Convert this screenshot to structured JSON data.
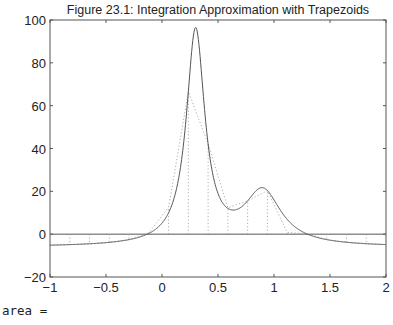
{
  "chart_data": {
    "type": "line",
    "title": "Figure 23.1: Integration Approximation with Trapezoids",
    "xlabel": "",
    "ylabel": "",
    "xlim": [
      -1,
      2
    ],
    "ylim": [
      -20,
      100
    ],
    "grid": false,
    "legend": null,
    "xticks": [
      -1,
      -0.5,
      0,
      0.5,
      1,
      1.5,
      2
    ],
    "xtick_labels": [
      "−1",
      "−0.5",
      "0",
      "0.5",
      "1",
      "1.5",
      "2"
    ],
    "yticks": [
      -20,
      0,
      20,
      40,
      60,
      80,
      100
    ],
    "ytick_labels": [
      "−20",
      "0",
      "20",
      "40",
      "60",
      "80",
      "100"
    ],
    "series": [
      {
        "name": "humps(x)",
        "style": "solid",
        "function": "1/((x-0.3)^2+0.01) + 1/((x-0.9)^2+0.04) - 6",
        "peak": {
          "x": 0.3,
          "y": 96.5
        },
        "local_min": {
          "x": 0.64,
          "y": 11.3
        },
        "second_peak": {
          "x": 0.89,
          "y": 21.7
        }
      },
      {
        "name": "trapezoids",
        "style": "dotted",
        "x": [
          -1.0,
          -0.8235,
          -0.6471,
          -0.4706,
          -0.2941,
          -0.1176,
          0.0588,
          0.2353,
          0.4118,
          0.5882,
          0.7647,
          0.9412,
          1.1176,
          1.2941,
          1.4706,
          1.6471,
          1.8235,
          2.0
        ],
        "y": [
          -5.14,
          -4.88,
          -4.49,
          -3.82,
          -2.46,
          0.67,
          12.5,
          66.58,
          42.15,
          12.38,
          15.55,
          20.36,
          0.81,
          0.12,
          -2.54,
          -3.78,
          -4.45,
          -4.86
        ]
      },
      {
        "name": "zero line",
        "style": "solid",
        "x": [
          -1,
          2
        ],
        "y": [
          0,
          0
        ]
      }
    ]
  },
  "console": {
    "text": "area ="
  }
}
